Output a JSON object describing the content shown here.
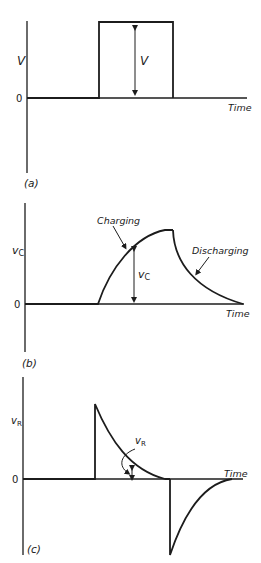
{
  "panels": [
    {
      "id": "a",
      "caption": "(a)",
      "y_label": "V",
      "zero_label": "0",
      "x_label": "Time",
      "annotation": "V",
      "signal": "square pulse"
    },
    {
      "id": "b",
      "caption": "(b)",
      "y_label": "vC",
      "y_label_main": "v",
      "y_label_sub": "C",
      "zero_label": "0",
      "x_label": "Time",
      "annotation_main": "v",
      "annotation_sub": "C",
      "curve_labels": {
        "rise": "Charging",
        "fall": "Discharging"
      },
      "signal": "capacitor voltage"
    },
    {
      "id": "c",
      "caption": "(c)",
      "y_label_main": "v",
      "y_label_sub": "R",
      "zero_label": "0",
      "x_label": "Time",
      "annotation_main": "v",
      "annotation_sub": "R",
      "signal": "resistor voltage"
    }
  ],
  "colors": {
    "ink": "#1c1c1c",
    "background": "#ffffff"
  }
}
